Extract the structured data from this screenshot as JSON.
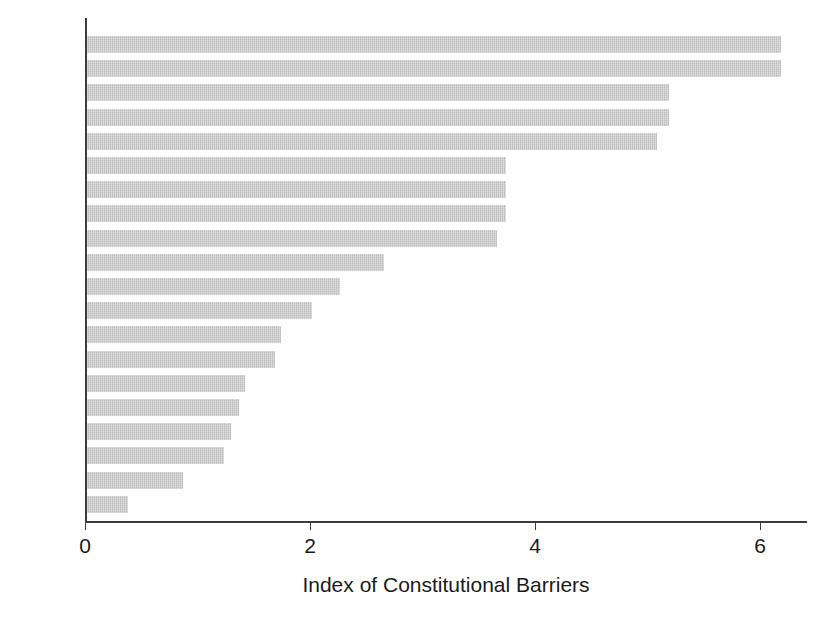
{
  "chart_data": {
    "type": "bar",
    "orientation": "horizontal",
    "title": "",
    "xlabel": "Index of Constitutional Barriers",
    "ylabel": "",
    "xlim": [
      0,
      6.42
    ],
    "ylim": null,
    "grid": false,
    "legend": null,
    "xticks": [
      0,
      2,
      4,
      6
    ],
    "xtick_labels": [
      "0",
      "2",
      "4",
      "6"
    ],
    "categories": [
      "SPA",
      "GER",
      "SWI",
      "POR",
      "ITA",
      "AUT",
      "GRE",
      "FRA",
      "BEL",
      "JPN",
      "IRE",
      "AUS",
      "SWE",
      "CAN",
      "NEL",
      "FIN",
      "NZL",
      "DEN",
      "NOR",
      "UK"
    ],
    "values": [
      6.17,
      6.17,
      5.17,
      5.17,
      5.07,
      3.72,
      3.72,
      3.72,
      3.64,
      2.64,
      2.25,
      2.0,
      1.72,
      1.67,
      1.4,
      1.35,
      1.28,
      1.22,
      0.85,
      0.36
    ],
    "bar_color": "#c9c9c9",
    "axis_color": "#3c3c3c"
  },
  "axis": {
    "x_title": "Index of Constitutional Barriers"
  }
}
